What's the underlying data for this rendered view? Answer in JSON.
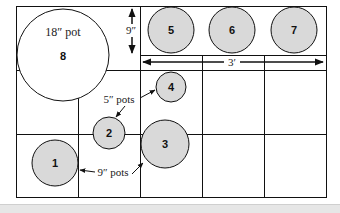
{
  "diagram": {
    "grid": {
      "cols": 5,
      "rows": 3,
      "line_color": "#111111"
    },
    "pots": [
      {
        "id": "1",
        "label": "1",
        "cx": 47,
        "cy": 163,
        "r": 24,
        "fill": "#d9d9d9"
      },
      {
        "id": "2",
        "label": "2",
        "cx": 109,
        "cy": 133,
        "r": 16,
        "fill": "#d9d9d9"
      },
      {
        "id": "3",
        "label": "3",
        "cx": 165,
        "cy": 144,
        "r": 24,
        "fill": "#d9d9d9"
      },
      {
        "id": "4",
        "label": "4",
        "cx": 171,
        "cy": 87,
        "r": 15,
        "fill": "#d9d9d9"
      },
      {
        "id": "5",
        "label": "5",
        "cx": 171,
        "cy": 30,
        "r": 23,
        "fill": "#d9d9d9"
      },
      {
        "id": "6",
        "label": "6",
        "cx": 232,
        "cy": 30,
        "r": 23,
        "fill": "#d9d9d9"
      },
      {
        "id": "7",
        "label": "7",
        "cx": 294,
        "cy": 30,
        "r": 23,
        "fill": "#d9d9d9"
      },
      {
        "id": "8",
        "label": "8",
        "cx": 63,
        "cy": 55,
        "r": 46,
        "fill": "#ffffff"
      }
    ],
    "labels": {
      "big_pot": "18″ pot",
      "small_pots": "5″ pots",
      "medium_pots": "9″ pots",
      "row_height": "9″",
      "row_width": "3′"
    }
  }
}
